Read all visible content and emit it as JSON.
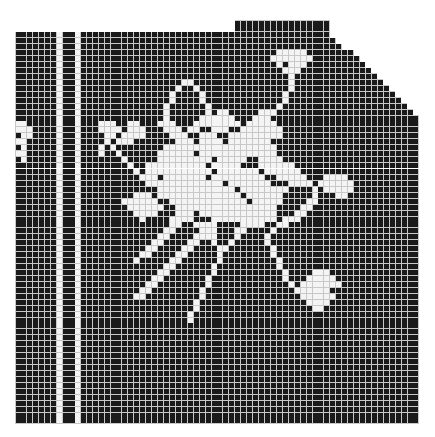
{
  "chart_data": {
    "type": "heatmap",
    "title": "",
    "cols": 68,
    "rows": 68,
    "cell_px": 5.94,
    "colors": {
      "filled": "#1a1a1a",
      "open": "#f4f4f4",
      "gridline": "#c8c8c8"
    },
    "row_extents": [
      [
        37,
        52
      ],
      [
        37,
        52
      ],
      [
        0,
        52
      ],
      [
        0,
        53
      ],
      [
        0,
        54
      ],
      [
        0,
        56
      ],
      [
        0,
        57
      ],
      [
        0,
        58
      ],
      [
        0,
        59
      ],
      [
        0,
        60
      ],
      [
        0,
        61
      ],
      [
        0,
        62
      ],
      [
        0,
        63
      ],
      [
        0,
        64
      ],
      [
        0,
        65
      ],
      [
        0,
        66
      ],
      [
        0,
        67
      ],
      [
        0,
        67
      ],
      [
        0,
        67
      ],
      [
        0,
        67
      ],
      [
        0,
        67
      ],
      [
        0,
        67
      ],
      [
        0,
        67
      ],
      [
        0,
        67
      ],
      [
        0,
        67
      ],
      [
        0,
        67
      ],
      [
        0,
        67
      ],
      [
        0,
        67
      ],
      [
        0,
        67
      ],
      [
        0,
        67
      ],
      [
        0,
        67
      ],
      [
        0,
        67
      ],
      [
        0,
        67
      ],
      [
        0,
        67
      ],
      [
        0,
        67
      ],
      [
        0,
        67
      ],
      [
        0,
        67
      ],
      [
        0,
        67
      ],
      [
        0,
        67
      ],
      [
        0,
        67
      ],
      [
        0,
        67
      ],
      [
        0,
        67
      ],
      [
        0,
        67
      ],
      [
        0,
        67
      ],
      [
        0,
        67
      ],
      [
        0,
        67
      ],
      [
        0,
        67
      ],
      [
        0,
        67
      ],
      [
        0,
        67
      ],
      [
        0,
        67
      ],
      [
        0,
        67
      ],
      [
        0,
        67
      ],
      [
        0,
        67
      ],
      [
        0,
        67
      ],
      [
        0,
        67
      ],
      [
        0,
        67
      ],
      [
        0,
        67
      ],
      [
        0,
        67
      ],
      [
        0,
        67
      ],
      [
        0,
        67
      ],
      [
        0,
        67
      ],
      [
        0,
        67
      ],
      [
        0,
        67
      ],
      [
        0,
        67
      ],
      [
        0,
        67
      ],
      [
        0,
        67
      ],
      [
        0,
        67
      ],
      [
        0,
        67
      ]
    ],
    "border_columns_open": [
      7,
      10
    ],
    "border_column_solid": [
      8,
      9
    ],
    "open_cells_rows": {
      "5": "44-48",
      "6": "43-49",
      "7": "44,46-48",
      "8": "45-47",
      "9": "46",
      "10": "28-29,46",
      "11": "27,30,46",
      "12": "26,31,45",
      "13": "26,31,45",
      "14": "25,32,44",
      "15": "25,32,34-35,41-43",
      "16": "25,31-36,40-42",
      "17": "0-1,14-16,19-20,24-26,30-37,39-43",
      "18": "0-2,14-17,19-21,25-27,29-30,33-35,38-44",
      "19": "1-2,15-16,18-21,26-28,31-33,36-44",
      "20": "0-1,15,17-19,27-29,31-34,36-42",
      "21": "1,14,16,25-43",
      "22": "0-1,14,17,24-29,31-43",
      "23": "1,18,24-32,34-38,41-44",
      "24": "19,22-31,33-37,41-46",
      "25": "20,22-32,34-40,42-47",
      "26": "21-23,25-31,33-41,44-48,52-55",
      "27": "22-34,36-42,46-49,51-56",
      "28": "24-36,38-45,50,52-56",
      "29": "20-22,24-37,39-44,50,54-55",
      "30": "18-23,26-38,40-44,49-50",
      "31": "19-24,27-43,48-49",
      "32": "20-23,27-29,31-43,47-48",
      "33": "21,26-29,33-43,45-47",
      "34": "26-27,30-33,38-41,44-45",
      "35": "25-26,31-33,37-38,43",
      "36": "24-25,30-31,32-33,37,42",
      "37": "23-24,29-30,33,36,42",
      "38": "22-23,28-29,34,35,43",
      "39": "21-22,27-28,34,43",
      "40": "20,26-27,34,44",
      "41": "25-26,33,44",
      "42": "24-25,33,45,50-52",
      "43": "23-24,32,45,49-53",
      "44": "22-23,32,46,48-54",
      "45": "21-22,31,47-52",
      "46": "20-21,31,48-53",
      "47": "30,49-52",
      "48": "30,50-51",
      "49": "29",
      "50": "29"
    }
  }
}
